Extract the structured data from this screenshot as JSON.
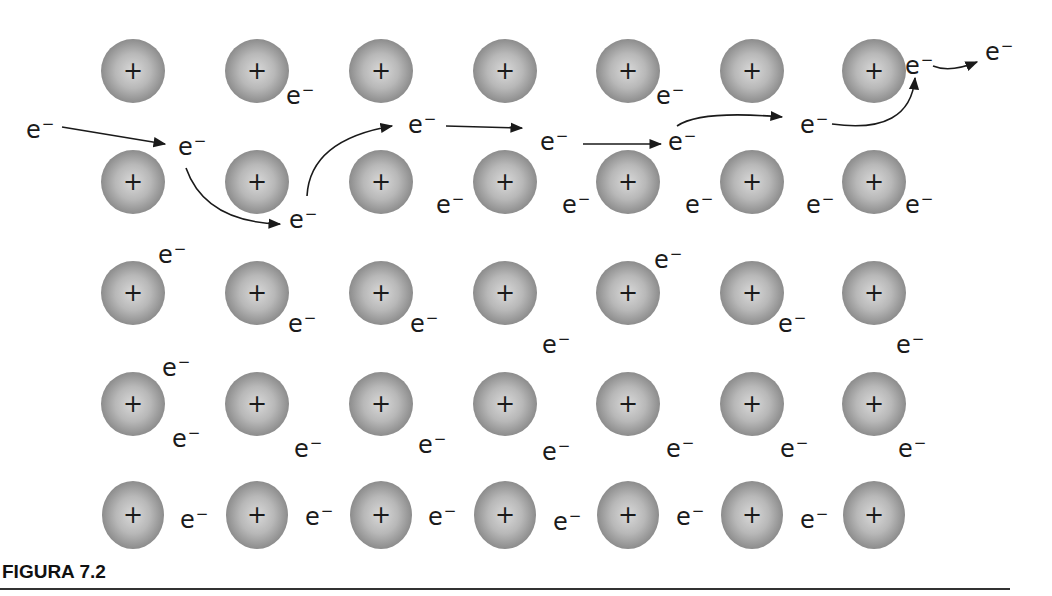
{
  "figure": {
    "caption": "FIGURA 7.2",
    "ion_label": "+",
    "electron_label": "e",
    "electron_charge": "−",
    "colors": {
      "ion_center": "#d9d9d9",
      "ion_edge": "#8c8c8c",
      "text": "#1a1a1a",
      "arrow": "#1a1a1a"
    },
    "ion_grid": {
      "columns_x": [
        133,
        257,
        381,
        505,
        628,
        752,
        874
      ],
      "rows_y": [
        71,
        182,
        293,
        404,
        515
      ],
      "radius": 32
    },
    "electrons": [
      {
        "x": 26,
        "y": 118
      },
      {
        "x": 178,
        "y": 135
      },
      {
        "x": 286,
        "y": 84
      },
      {
        "x": 289,
        "y": 208
      },
      {
        "x": 408,
        "y": 113
      },
      {
        "x": 540,
        "y": 130
      },
      {
        "x": 656,
        "y": 84
      },
      {
        "x": 668,
        "y": 130
      },
      {
        "x": 800,
        "y": 113
      },
      {
        "x": 905,
        "y": 54
      },
      {
        "x": 985,
        "y": 40
      },
      {
        "x": 436,
        "y": 193
      },
      {
        "x": 562,
        "y": 193
      },
      {
        "x": 685,
        "y": 193
      },
      {
        "x": 806,
        "y": 193
      },
      {
        "x": 905,
        "y": 193
      },
      {
        "x": 158,
        "y": 243
      },
      {
        "x": 288,
        "y": 312
      },
      {
        "x": 410,
        "y": 312
      },
      {
        "x": 542,
        "y": 333
      },
      {
        "x": 654,
        "y": 248
      },
      {
        "x": 778,
        "y": 312
      },
      {
        "x": 896,
        "y": 333
      },
      {
        "x": 162,
        "y": 356
      },
      {
        "x": 172,
        "y": 427
      },
      {
        "x": 294,
        "y": 437
      },
      {
        "x": 418,
        "y": 433
      },
      {
        "x": 542,
        "y": 440
      },
      {
        "x": 666,
        "y": 437
      },
      {
        "x": 780,
        "y": 437
      },
      {
        "x": 898,
        "y": 437
      },
      {
        "x": 180,
        "y": 508
      },
      {
        "x": 305,
        "y": 505
      },
      {
        "x": 428,
        "y": 505
      },
      {
        "x": 553,
        "y": 510
      },
      {
        "x": 676,
        "y": 505
      },
      {
        "x": 800,
        "y": 508
      }
    ],
    "path_arrows": [
      {
        "d": "M 62 127 L 165 144",
        "label": "arrow-1"
      },
      {
        "d": "M 186 168 Q 205 222 280 224",
        "label": "arrow-2"
      },
      {
        "d": "M 307 196 Q 310 140 392 126",
        "label": "arrow-3"
      },
      {
        "d": "M 446 126 L 522 128",
        "label": "arrow-4"
      },
      {
        "d": "M 583 144 L 661 144",
        "label": "arrow-5"
      },
      {
        "d": "M 677 126 Q 700 110 782 117",
        "label": "arrow-6"
      },
      {
        "d": "M 832 124 Q 910 135 915 78",
        "label": "arrow-7"
      },
      {
        "d": "M 933 66 Q 950 73 977 62",
        "label": "arrow-8"
      }
    ]
  }
}
